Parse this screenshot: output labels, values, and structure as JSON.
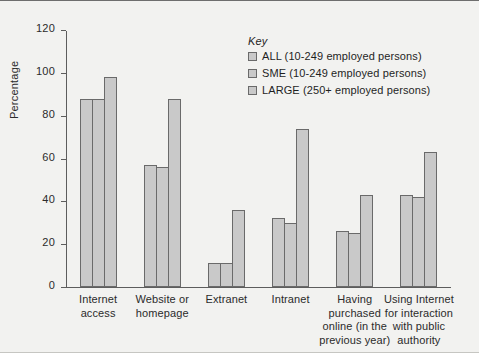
{
  "chart_data": {
    "type": "bar",
    "title": "",
    "xlabel": "",
    "ylabel": "Percentage",
    "ylim": [
      0,
      120
    ],
    "ytick_step": 20,
    "yticks": [
      0,
      20,
      40,
      60,
      80,
      100,
      120
    ],
    "grid": false,
    "legend_position": "inside-top-center",
    "legend_title": "Key",
    "categories": [
      "Internet\naccess",
      "Website or\nhomepage",
      "Extranet",
      "Intranet",
      "Having\npurchased\nonline (in the\nprevious year)",
      "Using Internet\nfor interaction\nwith public\nauthority"
    ],
    "series": [
      {
        "name": "ALL (10-249 employed persons)",
        "values": [
          88,
          57,
          11,
          32,
          26,
          43
        ]
      },
      {
        "name": "SME (10-249 employed persons)",
        "values": [
          88,
          56,
          11,
          30,
          25,
          42
        ]
      },
      {
        "name": "LARGE (250+ employed persons)",
        "values": [
          98,
          88,
          36,
          74,
          43,
          63
        ]
      }
    ],
    "colors": {
      "bar_fill": "#c9c9c9",
      "bar_border": "#6a6a6a",
      "axis": "#5d5d5d",
      "text": "#2b2b2b",
      "background": "#f2f2f0"
    }
  }
}
